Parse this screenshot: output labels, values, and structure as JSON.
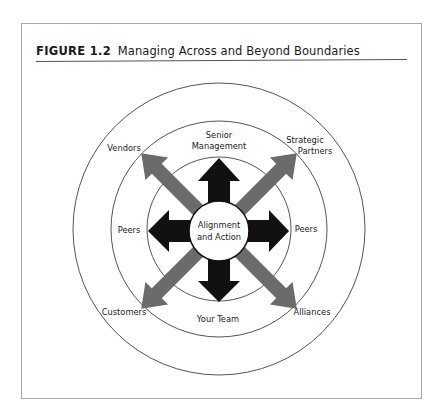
{
  "figure": {
    "label": "FIGURE 1.2",
    "title": "Managing Across and Beyond Boundaries"
  },
  "diagram": {
    "center": {
      "line1": "Alignment",
      "line2": "and Action"
    },
    "inner_ring_labels": {
      "top_line1": "Senior",
      "top_line2": "Management",
      "left": "Peers",
      "right": "Peers",
      "bottom": "Your Team"
    },
    "outer_ring_labels": {
      "top_left": "Vendors",
      "top_right_line1": "Strategic",
      "top_right_line2": "Partners",
      "bottom_left": "Customers",
      "bottom_right": "Alliances"
    },
    "colors": {
      "black_arrows": "#111111",
      "gray_arrows": "#6b6b6b",
      "circle_stroke": "#555555"
    }
  }
}
